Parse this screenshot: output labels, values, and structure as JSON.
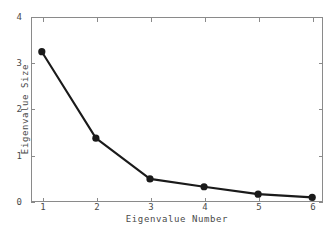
{
  "chart_data": {
    "type": "line",
    "title": "",
    "xlabel": "Eigenvalue Number",
    "ylabel": "Eigenvalue Size",
    "x": [
      1,
      2,
      3,
      4,
      5,
      6
    ],
    "values": [
      3.25,
      1.38,
      0.5,
      0.33,
      0.17,
      0.1
    ],
    "categories": [
      "1",
      "2",
      "3",
      "4",
      "5",
      "6"
    ],
    "xlim": [
      0.8,
      6.2
    ],
    "ylim": [
      0,
      4
    ],
    "x_tick_labels": [
      "1",
      "2",
      "3",
      "4",
      "5",
      "6"
    ],
    "y_tick_labels": [
      "0",
      "1",
      "2",
      "3",
      "4"
    ],
    "y_ticks": [
      0,
      1,
      2,
      3,
      4
    ],
    "grid": false,
    "legend": false,
    "legend_position": "none",
    "marker": "circle",
    "line_color": "#1a1a1a",
    "marker_color": "#1a1a1a",
    "frame_color": "#8a8a8a",
    "background_color": "#ffffff",
    "text_color": "#4a4a4a"
  }
}
